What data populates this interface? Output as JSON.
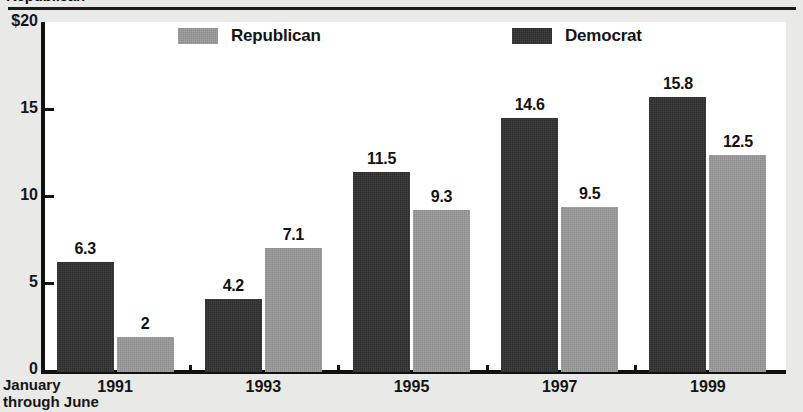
{
  "headline": {
    "clipped_title": "Republican"
  },
  "chart_data": {
    "type": "bar",
    "title": "Republican",
    "xlabel": "",
    "ylabel": "",
    "ylim": [
      0,
      20
    ],
    "yticks": [
      0,
      5,
      10,
      15,
      20
    ],
    "ytick_labels": [
      "0",
      "5",
      "10",
      "15",
      "$20"
    ],
    "grid": false,
    "legend_position": "top",
    "categories": [
      "1991",
      "1993",
      "1995",
      "1997",
      "1999"
    ],
    "axis_note": "January\nthrough June",
    "axis_note_line1": "January",
    "axis_note_line2": "through June",
    "series": [
      {
        "name": "Democrat",
        "color": "#2d2d2d",
        "values": [
          6.3,
          4.2,
          11.5,
          14.6,
          15.8
        ],
        "labels": [
          "6.3",
          "4.2",
          "11.5",
          "14.6",
          "15.8"
        ]
      },
      {
        "name": "Republican",
        "color": "#8c8c8c",
        "values": [
          2,
          7.1,
          9.3,
          9.5,
          12.5
        ],
        "labels": [
          "2",
          "7.1",
          "9.3",
          "9.5",
          "12.5"
        ]
      }
    ]
  },
  "legend": {
    "entries": [
      {
        "label": "Republican",
        "color": "#8c8c8c"
      },
      {
        "label": "Democrat",
        "color": "#2d2d2d"
      }
    ]
  }
}
